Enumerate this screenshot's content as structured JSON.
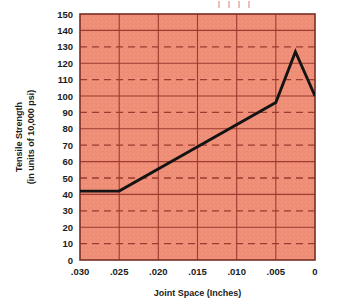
{
  "chart_data": {
    "type": "line",
    "title": "",
    "xlabel": "Joint Space (Inches)",
    "ylabel_line1": "Tensile Strength",
    "ylabel_line2": "(in units of 10,000 psi)",
    "x_tick_labels": [
      ".030",
      ".025",
      ".020",
      ".015",
      ".010",
      ".005",
      "0"
    ],
    "x_tick_values": [
      0.03,
      0.025,
      0.02,
      0.015,
      0.01,
      0.005,
      0
    ],
    "y_tick_labels": [
      "150",
      "140",
      "130",
      "120",
      "110",
      "100",
      "90",
      "80",
      "70",
      "60",
      "50",
      "40",
      "30",
      "20",
      "10",
      "0"
    ],
    "y_tick_values": [
      150,
      140,
      130,
      120,
      110,
      100,
      90,
      80,
      70,
      60,
      50,
      40,
      30,
      20,
      10,
      0
    ],
    "xlim": [
      0.03,
      0.0
    ],
    "ylim": [
      0,
      150
    ],
    "x_axis_inverted": true,
    "grid": true,
    "grid_solid_values": [
      140,
      120,
      100,
      80,
      60,
      40,
      20,
      0
    ],
    "grid_dashed_values": [
      130,
      110,
      90,
      70,
      50,
      30,
      10
    ],
    "legend": "none",
    "x": [
      0.03,
      0.025,
      0.005,
      0.0025,
      0.0
    ],
    "values": [
      42,
      42,
      96,
      127,
      100
    ],
    "series": [
      {
        "name": "Tensile Strength",
        "points": [
          {
            "x": 0.03,
            "y": 42
          },
          {
            "x": 0.025,
            "y": 42
          },
          {
            "x": 0.005,
            "y": 96
          },
          {
            "x": 0.0025,
            "y": 127
          },
          {
            "x": 0.0,
            "y": 100
          }
        ]
      }
    ],
    "colors": {
      "plot_background": "#ef8f78",
      "grid_line": "#9c3b2e",
      "data_line": "#141414",
      "axis_text": "#1b1b1b",
      "frame": "#7a2e22"
    }
  }
}
